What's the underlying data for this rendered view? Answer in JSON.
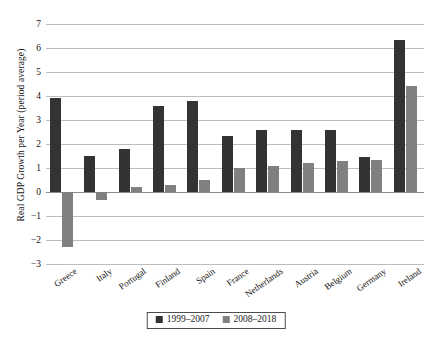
{
  "chart_data": {
    "type": "bar",
    "title": "",
    "xlabel": "",
    "ylabel": "Real GDP Growth per Year (period average)",
    "ylim": [
      -3,
      7
    ],
    "yticks": [
      7,
      6,
      5,
      4,
      3,
      2,
      1,
      0,
      -1,
      -2,
      -3
    ],
    "ytick_labels": [
      "7",
      "6",
      "5",
      "4",
      "3",
      "2",
      "1",
      "0",
      "−1",
      "−2",
      "−3"
    ],
    "grid": true,
    "legend_position": "bottom-center",
    "categories": [
      "Greece",
      "Italy",
      "Portugal",
      "Finland",
      "Spain",
      "France",
      "Netherlands",
      "Austria",
      "Belgium",
      "Germany",
      "Ireland"
    ],
    "series": [
      {
        "name": "1999–2007",
        "color": "#333333",
        "values": [
          3.9,
          1.5,
          1.8,
          3.6,
          3.8,
          2.35,
          2.6,
          2.6,
          2.6,
          1.45,
          6.35
        ]
      },
      {
        "name": "2008–2018",
        "color": "#808080",
        "values": [
          -2.3,
          -0.35,
          0.2,
          0.3,
          0.5,
          1.0,
          1.1,
          1.2,
          1.3,
          1.35,
          4.4
        ]
      }
    ]
  },
  "legend": {
    "entries": [
      {
        "label": "1999–2007"
      },
      {
        "label": "2008–2018"
      }
    ]
  },
  "colors": {
    "series_1999_2007": "#333333",
    "series_2008_2018": "#808080",
    "gridline": "#bdbdbd",
    "zero_line": "#8c8c8c",
    "background": "#ffffff"
  }
}
